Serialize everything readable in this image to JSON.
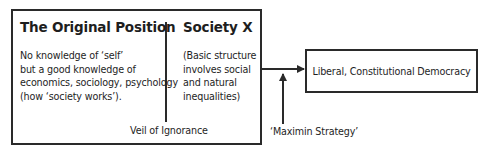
{
  "original_position": {
    "title": "The Original Position",
    "lines": [
      "No knowledge of ‘self’",
      "but a good knowledge of",
      "economics, sociology, psychology",
      "(how ‘society works’)."
    ]
  },
  "society_x": {
    "title": "Society X",
    "lines": [
      "(Basic structure",
      "involves social",
      "and natural",
      "inequalities)"
    ]
  },
  "veil_label": "Veil of Ignorance",
  "outcome": "Liberal, Constitutional Democracy",
  "maximin_label": "‘Maximin Strategy’",
  "colors": {
    "stroke": "#2a2a2a",
    "text": "#1e1e1e",
    "background": "#ffffff"
  }
}
